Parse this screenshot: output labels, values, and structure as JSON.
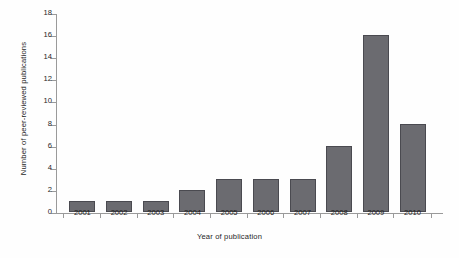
{
  "chart_data": {
    "type": "bar",
    "title": "",
    "xlabel": "Year of publication",
    "ylabel": "Number of peer-reviewed publications",
    "categories": [
      "2001",
      "2002",
      "2003",
      "2004",
      "2005",
      "2006",
      "2007",
      "2008",
      "2009",
      "2010"
    ],
    "values": [
      1,
      1,
      1,
      2,
      3,
      3,
      3,
      6,
      16,
      8
    ],
    "ylim": [
      0,
      18
    ],
    "ytick_step": 2,
    "yticks": [
      "0",
      "2",
      "4",
      "6",
      "8",
      "10",
      "12",
      "14",
      "16",
      "18"
    ],
    "grid": false,
    "legend": null,
    "legend_position": "none",
    "series": [
      {
        "name": "Peer-reviewed publications",
        "values": [
          1,
          1,
          1,
          2,
          3,
          3,
          3,
          6,
          16,
          8
        ]
      }
    ],
    "colors": {
      "bar_fill": "#6b6b70",
      "bar_border": "#4a4a50",
      "axis": "#9a9a9a",
      "text": "#1f1f1f",
      "background": "#ffffff"
    }
  }
}
